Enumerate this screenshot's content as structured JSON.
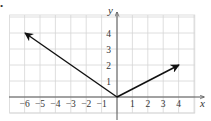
{
  "figure": {
    "bullet": "•",
    "x_axis_label": "x",
    "y_axis_label": "y",
    "x_tick_labels": [
      "−6",
      "−5",
      "−4",
      "−3",
      "−2",
      "−1",
      "1",
      "2",
      "3",
      "4"
    ],
    "y_tick_labels": [
      "1",
      "2",
      "3",
      "4"
    ],
    "colors": {
      "grid": "#d6d6d6",
      "axis": "#555555",
      "vector": "#111111"
    }
  },
  "chart_data": {
    "type": "line",
    "title": "",
    "xlabel": "x",
    "ylabel": "y",
    "xlim": [
      -7,
      5
    ],
    "ylim": [
      -1,
      5
    ],
    "grid": true,
    "x_ticks": [
      -6,
      -5,
      -4,
      -3,
      -2,
      -1,
      1,
      2,
      3,
      4
    ],
    "y_ticks": [
      1,
      2,
      3,
      4
    ],
    "series": [
      {
        "name": "vector to (-6, 4)",
        "x": [
          0,
          -6
        ],
        "y": [
          0,
          4
        ],
        "arrow": true
      },
      {
        "name": "vector to (4, 2)",
        "x": [
          0,
          4
        ],
        "y": [
          0,
          2
        ],
        "arrow": true
      }
    ]
  }
}
